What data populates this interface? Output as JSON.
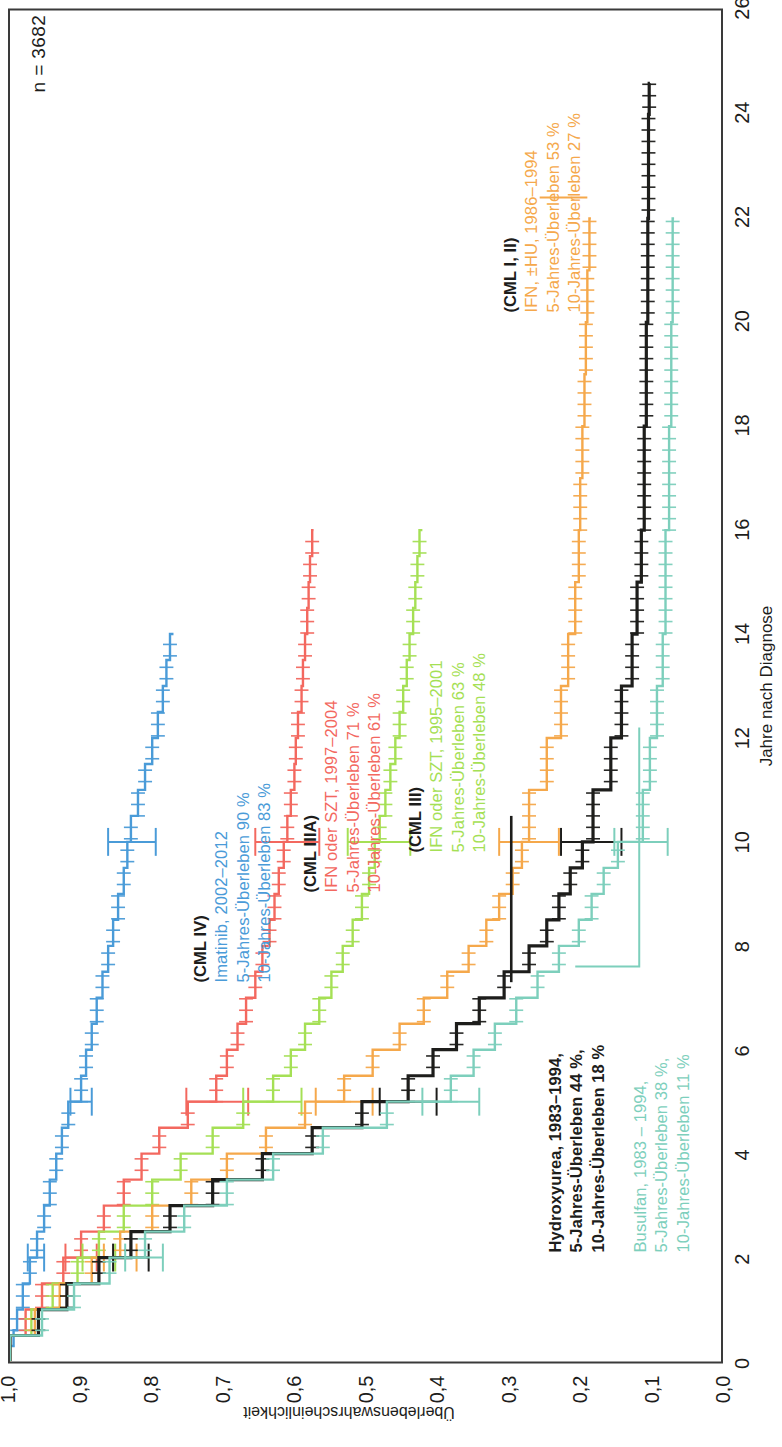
{
  "annotation_n": "n = 3682",
  "axes": {
    "x_title": "Jahre nach Diagnose",
    "y_title": "Überlebenswahrscheinlichkeit",
    "x_ticks": [
      "0",
      "2",
      "4",
      "6",
      "8",
      "10",
      "12",
      "14",
      "16",
      "18",
      "20",
      "22",
      "24",
      "26"
    ],
    "y_ticks": [
      "0,0",
      "0,1",
      "0,2",
      "0,3",
      "0,4",
      "0,5",
      "0,6",
      "0,7",
      "0,8",
      "0,9",
      "1,0"
    ]
  },
  "groups": [
    {
      "key": "cml4",
      "header": "(CML IV)",
      "line1": "Imatinib, 2002–2012",
      "line2": "5-Jahres-Überleben 90 %",
      "line3": "10-Jahres-Überleben 83 %",
      "color": "#4A9BD8",
      "surv5": 0.9,
      "surv10": 0.83
    },
    {
      "key": "cml3a",
      "header": "(CML IIIA)",
      "line1": "IFN oder SZT, 1997–2004",
      "line2": "5-Jahres-Überleben 71 %",
      "line3": "10-Jahres-Überleben 61 %",
      "color": "#F3685F",
      "surv5": 0.71,
      "surv10": 0.61
    },
    {
      "key": "cml3",
      "header": "(CML III)",
      "line1": "IFN oder SZT, 1995–2001",
      "line2": "5-Jahres-Überleben 63 %",
      "line3": "10-Jahres-Überleben 48 %",
      "color": "#A5E055",
      "surv5": 0.63,
      "surv10": 0.48
    },
    {
      "key": "cml12",
      "header": "(CML I, II)",
      "line1": "IFN, ±HU, 1986–1994",
      "line2": "5-Jahres-Überleben 53 %",
      "line3": "10-Jahres-Überleben 27 %",
      "color": "#F5A84B",
      "surv5": 0.53,
      "surv10": 0.27
    },
    {
      "key": "hu",
      "header": "",
      "line1": "Hydroxyurea, 1983–1994,",
      "line2": "5-Jahres-Überleben 44 %,",
      "line3": "10-Jahres-Überleben 18 %",
      "color": "#1d1d1b",
      "surv5": 0.44,
      "surv10": 0.18
    },
    {
      "key": "bu",
      "header": "",
      "line1": "Busulfan, 1983 – 1994,",
      "line2": "5-Jahres-Überleben 38 %,",
      "line3": "10-Jahres-Überleben 11 %",
      "color": "#7DCFBC",
      "surv5": 0.38,
      "surv10": 0.11
    }
  ],
  "chart_data": {
    "type": "line",
    "title": "",
    "xlabel": "Jahre nach Diagnose",
    "ylabel": "Überlebenswahrscheinlichkeit",
    "xlim": [
      0,
      26
    ],
    "ylim": [
      0.0,
      1.0
    ],
    "grid": false,
    "legend": "in-plot annotations",
    "annotation": "n = 3682",
    "series": [
      {
        "name": "(CML IV) Imatinib, 2002–2012",
        "color": "#4A9BD8",
        "surv5": 0.9,
        "surv10": 0.83,
        "x": [
          0,
          0.3,
          0.6,
          1,
          1.5,
          2,
          2.5,
          3,
          3.5,
          4,
          4.5,
          5,
          5.5,
          6,
          6.5,
          7,
          7.5,
          8,
          8.5,
          9,
          9.5,
          10,
          10.5,
          11,
          11.5,
          12,
          12.5,
          13,
          13.5,
          14
        ],
        "y": [
          1.0,
          0.995,
          0.99,
          0.982,
          0.972,
          0.962,
          0.952,
          0.944,
          0.935,
          0.927,
          0.918,
          0.9,
          0.893,
          0.885,
          0.878,
          0.87,
          0.862,
          0.855,
          0.848,
          0.84,
          0.835,
          0.83,
          0.82,
          0.81,
          0.8,
          0.792,
          0.785,
          0.78,
          0.775,
          0.77
        ],
        "ci10": [
          0.795,
          0.862
        ],
        "ci5": [
          0.885,
          0.915
        ],
        "ci2": [
          0.952,
          0.975
        ]
      },
      {
        "name": "(CML IIIA) IFN oder SZT, 1997–2004",
        "color": "#F3685F",
        "surv5": 0.71,
        "surv10": 0.61,
        "x": [
          0,
          0.5,
          1,
          1.5,
          2,
          2.5,
          3,
          3.5,
          4,
          4.5,
          5,
          5.5,
          6,
          6.5,
          7,
          7.5,
          8,
          8.5,
          9,
          9.5,
          10,
          10.5,
          11,
          11.5,
          12,
          12.5,
          13,
          13.5,
          14,
          14.5,
          15,
          15.5,
          16
        ],
        "y": [
          1.0,
          0.978,
          0.955,
          0.925,
          0.9,
          0.868,
          0.84,
          0.815,
          0.79,
          0.75,
          0.71,
          0.695,
          0.68,
          0.668,
          0.655,
          0.645,
          0.635,
          0.628,
          0.622,
          0.615,
          0.61,
          0.605,
          0.6,
          0.598,
          0.595,
          0.59,
          0.588,
          0.585,
          0.582,
          0.58,
          0.578,
          0.575,
          0.573
        ],
        "ci10": [
          0.565,
          0.655
        ],
        "ci5": [
          0.665,
          0.752
        ],
        "ci2": [
          0.878,
          0.922
        ]
      },
      {
        "name": "(CML III) IFN oder SZT, 1995–2001",
        "color": "#A5E055",
        "surv5": 0.63,
        "surv10": 0.48,
        "x": [
          0,
          0.5,
          1,
          1.5,
          2,
          2.5,
          3,
          3.5,
          4,
          4.5,
          5,
          5.5,
          6,
          6.5,
          7,
          7.5,
          8,
          8.5,
          9,
          9.5,
          10,
          10.5,
          11,
          11.5,
          12,
          12.5,
          13,
          13.5,
          14,
          14.5,
          15,
          15.5,
          16
        ],
        "y": [
          1.0,
          0.97,
          0.94,
          0.905,
          0.875,
          0.84,
          0.8,
          0.76,
          0.715,
          0.672,
          0.63,
          0.605,
          0.585,
          0.565,
          0.548,
          0.532,
          0.518,
          0.505,
          0.495,
          0.487,
          0.48,
          0.472,
          0.465,
          0.458,
          0.452,
          0.447,
          0.442,
          0.438,
          0.433,
          0.43,
          0.427,
          0.424,
          0.42
        ],
        "ci10": [
          0.437,
          0.525
        ],
        "ci5": [
          0.59,
          0.672
        ],
        "ci2": [
          0.852,
          0.898
        ]
      },
      {
        "name": "(CML I, II) IFN, ±HU, 1986–1994",
        "color": "#F5A84B",
        "surv5": 0.53,
        "surv10": 0.27,
        "x": [
          0,
          0.5,
          1,
          1.5,
          2,
          2.5,
          3,
          3.5,
          4,
          4.5,
          5,
          5.5,
          6,
          6.5,
          7,
          7.5,
          8,
          8.5,
          9,
          9.5,
          10,
          11,
          12,
          13,
          14,
          15,
          16,
          17,
          18,
          19,
          20,
          21,
          22
        ],
        "y": [
          1.0,
          0.965,
          0.93,
          0.885,
          0.845,
          0.8,
          0.745,
          0.695,
          0.64,
          0.585,
          0.53,
          0.49,
          0.452,
          0.418,
          0.385,
          0.355,
          0.33,
          0.312,
          0.293,
          0.28,
          0.27,
          0.245,
          0.225,
          0.215,
          0.205,
          0.2,
          0.198,
          0.195,
          0.192,
          0.19,
          0.188,
          0.185,
          0.183
        ],
        "ci10": [
          0.228,
          0.312
        ],
        "ci5": [
          0.49,
          0.57
        ],
        "ci2": [
          0.822,
          0.868
        ]
      },
      {
        "name": "Hydroxyurea, 1983–1994",
        "color": "#1d1d1b",
        "surv5": 0.44,
        "surv10": 0.18,
        "x": [
          0,
          0.5,
          1,
          1.5,
          2,
          2.5,
          3,
          3.5,
          4,
          4.5,
          5,
          5.5,
          6,
          6.5,
          7,
          7.5,
          8,
          8.5,
          9,
          9.5,
          10,
          11,
          12,
          13,
          14,
          15,
          16,
          18,
          20,
          22,
          24,
          24.6
        ],
        "y": [
          1.0,
          0.96,
          0.92,
          0.875,
          0.83,
          0.775,
          0.715,
          0.645,
          0.575,
          0.505,
          0.44,
          0.405,
          0.372,
          0.34,
          0.305,
          0.27,
          0.245,
          0.228,
          0.212,
          0.195,
          0.18,
          0.155,
          0.14,
          0.125,
          0.118,
          0.112,
          0.108,
          0.105,
          0.103,
          0.102,
          0.101,
          0.1
        ],
        "ci10": [
          0.14,
          0.225
        ],
        "ci5": [
          0.4,
          0.48
        ],
        "ci2": [
          0.805,
          0.855
        ]
      },
      {
        "name": "Busulfan, 1983–1994",
        "color": "#7DCFBC",
        "surv5": 0.38,
        "surv10": 0.11,
        "x": [
          0,
          0.5,
          1,
          1.5,
          2,
          2.5,
          3,
          3.5,
          4,
          4.5,
          5,
          5.5,
          6,
          6.5,
          7,
          7.5,
          8,
          8.5,
          9,
          9.5,
          10,
          11,
          12,
          13,
          14,
          16,
          18,
          20,
          22
        ],
        "y": [
          1.0,
          0.955,
          0.91,
          0.86,
          0.81,
          0.755,
          0.695,
          0.63,
          0.56,
          0.47,
          0.38,
          0.348,
          0.318,
          0.288,
          0.258,
          0.228,
          0.2,
          0.182,
          0.165,
          0.145,
          0.11,
          0.1,
          0.09,
          0.082,
          0.078,
          0.073,
          0.07,
          0.068,
          0.066
        ],
        "ci10": [
          0.075,
          0.15
        ],
        "ci5": [
          0.34,
          0.42
        ],
        "ci2": [
          0.785,
          0.838
        ]
      }
    ]
  }
}
